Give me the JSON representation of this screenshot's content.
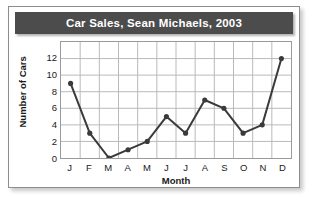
{
  "card": {
    "title": "Car Sales, Sean Michaels, 2003"
  },
  "chart_data": {
    "type": "line",
    "title": "Car Sales, Sean Michaels, 2003",
    "xlabel": "Month",
    "ylabel": "Number of Cars",
    "categories": [
      "J",
      "F",
      "M",
      "A",
      "M",
      "J",
      "J",
      "A",
      "S",
      "O",
      "N",
      "D"
    ],
    "values": [
      9,
      3,
      0,
      1,
      2,
      5,
      3,
      7,
      6,
      3,
      4,
      12
    ],
    "ylim": [
      0,
      14
    ],
    "yticks": [
      0,
      2,
      4,
      6,
      8,
      10,
      12
    ],
    "xlim_cells": 12,
    "grid": true,
    "legend": "none",
    "series_color": "#3a3a3a",
    "grid_color": "#b9b9b9",
    "title_bar_color": "#4c4c4c",
    "title_text_color": "#ffffff"
  }
}
